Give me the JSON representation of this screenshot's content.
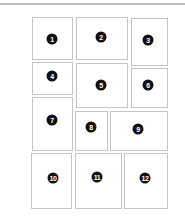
{
  "layout": {
    "panels": [
      {
        "label": "1",
        "x": 32,
        "y": 17,
        "w": 41,
        "h": 43,
        "bx": 52,
        "by": 39
      },
      {
        "label": "2",
        "x": 76,
        "y": 17,
        "w": 52,
        "h": 43,
        "bx": 101,
        "by": 37
      },
      {
        "label": "3",
        "x": 131,
        "y": 18,
        "w": 37,
        "h": 48,
        "bx": 148,
        "by": 40
      },
      {
        "label": "4",
        "x": 32,
        "y": 62,
        "w": 41,
        "h": 33,
        "bx": 52,
        "by": 76
      },
      {
        "label": "5",
        "x": 76,
        "y": 63,
        "w": 52,
        "h": 45,
        "bx": 101,
        "by": 85
      },
      {
        "label": "6",
        "x": 131,
        "y": 68,
        "w": 37,
        "h": 40,
        "bx": 148,
        "by": 85
      },
      {
        "label": "7",
        "x": 32,
        "y": 97,
        "w": 41,
        "h": 54,
        "bx": 52,
        "by": 120
      },
      {
        "label": "8",
        "x": 75,
        "y": 111,
        "w": 33,
        "h": 40,
        "bx": 91,
        "by": 127
      },
      {
        "label": "9",
        "x": 110,
        "y": 111,
        "w": 58,
        "h": 40,
        "bx": 138,
        "by": 129
      },
      {
        "label": "10",
        "x": 31,
        "y": 153,
        "w": 41,
        "h": 56,
        "bx": 53,
        "by": 178
      },
      {
        "label": "11",
        "x": 75,
        "y": 153,
        "w": 47,
        "h": 56,
        "bx": 97,
        "by": 177
      },
      {
        "label": "12",
        "x": 124,
        "y": 153,
        "w": 44,
        "h": 56,
        "bx": 145,
        "by": 178
      }
    ]
  }
}
